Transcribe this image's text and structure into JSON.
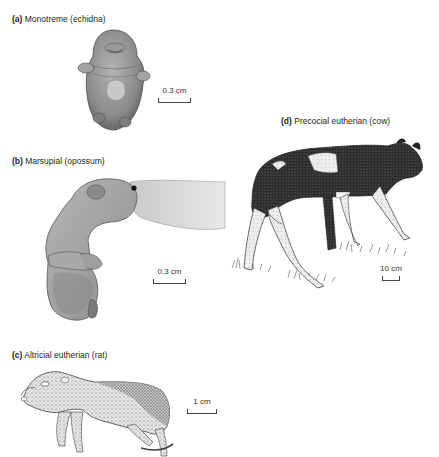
{
  "figure": {
    "panels": [
      {
        "id": "a",
        "letter": "(a)",
        "title": "Monotreme (echidna)",
        "scale_label": "0.3 cm"
      },
      {
        "id": "b",
        "letter": "(b)",
        "title": "Marsupial (opossum)",
        "scale_label": "0.3 cm"
      },
      {
        "id": "c",
        "letter": "(c)",
        "title": "Altricial eutherian (rat)",
        "scale_label": "1 cm"
      },
      {
        "id": "d",
        "letter": "(d)",
        "title": "Precocial eutherian (cow)",
        "scale_label": "10 cm"
      }
    ]
  }
}
